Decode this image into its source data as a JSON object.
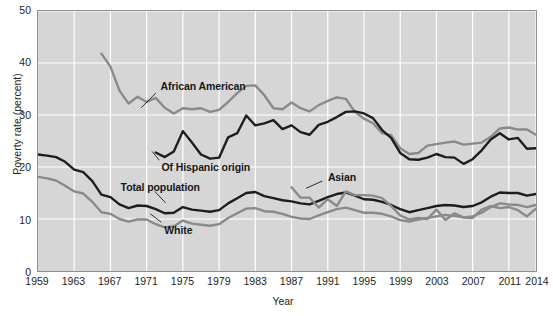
{
  "chart_data": {
    "type": "line",
    "title": "",
    "xlabel": "Year",
    "ylabel": "Poverty rate (percent)",
    "xlim": [
      1959,
      2014
    ],
    "ylim": [
      0,
      50
    ],
    "ytick_values": [
      0,
      10,
      20,
      30,
      40,
      50
    ],
    "ytick_labels": [
      "0",
      "10",
      "20",
      "30",
      "40",
      "50"
    ],
    "xtick_values": [
      1959,
      1963,
      1967,
      1971,
      1975,
      1979,
      1983,
      1987,
      1991,
      1995,
      1999,
      2003,
      2007,
      2011,
      2014
    ],
    "xtick_labels": [
      "1959",
      "1963",
      "1967",
      "1971",
      "1975",
      "1979",
      "1983",
      "1987",
      "1991",
      "1995",
      "1999",
      "2003",
      "2007",
      "2011",
      "2014"
    ],
    "grid": "both",
    "legend_position": "inline-annotations",
    "plot_background": "#d6d6d6",
    "gridline_color": "#ffffff",
    "series": [
      {
        "name": "African American",
        "color": "#8a8a8a",
        "label_x": 1972.6,
        "label_y": 35.6,
        "leader_from": [
          1972.0,
          34.2
        ],
        "leader_to": [
          1970.4,
          31.4
        ],
        "x": [
          1966,
          1967,
          1968,
          1969,
          1970,
          1971,
          1972,
          1973,
          1974,
          1975,
          1976,
          1977,
          1978,
          1979,
          1980,
          1981,
          1982,
          1983,
          1984,
          1985,
          1986,
          1987,
          1988,
          1989,
          1990,
          1991,
          1992,
          1993,
          1994,
          1995,
          1996,
          1997,
          1998,
          1999,
          2000,
          2001,
          2002,
          2003,
          2004,
          2005,
          2006,
          2007,
          2008,
          2009,
          2010,
          2011,
          2012,
          2013,
          2014
        ],
        "values": [
          41.8,
          39.3,
          34.7,
          32.2,
          33.5,
          32.5,
          33.3,
          31.4,
          30.3,
          31.3,
          31.1,
          31.3,
          30.6,
          31.0,
          32.5,
          34.2,
          35.6,
          35.7,
          33.8,
          31.3,
          31.1,
          32.4,
          31.3,
          30.7,
          31.9,
          32.7,
          33.4,
          33.1,
          30.6,
          29.3,
          28.4,
          26.5,
          26.1,
          23.6,
          22.5,
          22.7,
          24.1,
          24.4,
          24.7,
          24.9,
          24.3,
          24.5,
          24.7,
          25.8,
          27.4,
          27.6,
          27.2,
          27.2,
          26.2
        ]
      },
      {
        "name": "Of Hispanic origin",
        "color": "#1d1d1d",
        "label_x": 1972.7,
        "label_y": 20.0,
        "leader_from": [
          1972.4,
          21.3
        ],
        "leader_to": [
          1971.6,
          23.0
        ],
        "x": [
          1972,
          1973,
          1974,
          1975,
          1976,
          1977,
          1978,
          1979,
          1980,
          1981,
          1982,
          1983,
          1984,
          1985,
          1986,
          1987,
          1988,
          1989,
          1990,
          1991,
          1992,
          1993,
          1994,
          1995,
          1996,
          1997,
          1998,
          1999,
          2000,
          2001,
          2002,
          2003,
          2004,
          2005,
          2006,
          2007,
          2008,
          2009,
          2010,
          2011,
          2012,
          2013,
          2014
        ],
        "values": [
          22.8,
          21.9,
          23.0,
          26.9,
          24.7,
          22.4,
          21.6,
          21.8,
          25.7,
          26.5,
          29.9,
          28.0,
          28.4,
          29.0,
          27.3,
          28.0,
          26.7,
          26.2,
          28.1,
          28.7,
          29.6,
          30.6,
          30.7,
          30.3,
          29.4,
          27.1,
          25.6,
          22.7,
          21.5,
          21.4,
          21.8,
          22.5,
          21.9,
          21.8,
          20.6,
          21.5,
          23.2,
          25.3,
          26.5,
          25.3,
          25.6,
          23.5,
          23.6
        ]
      },
      {
        "name": "Total population",
        "color": "#1d1d1d",
        "label_x": 1968.2,
        "label_y": 16.2,
        "leader_from": [
          1971.9,
          15.3
        ],
        "leader_to": [
          1973.1,
          13.1
        ],
        "x": [
          1959,
          1960,
          1961,
          1962,
          1963,
          1964,
          1965,
          1966,
          1967,
          1968,
          1969,
          1970,
          1971,
          1972,
          1973,
          1974,
          1975,
          1976,
          1977,
          1978,
          1979,
          1980,
          1981,
          1982,
          1983,
          1984,
          1985,
          1986,
          1987,
          1988,
          1989,
          1990,
          1991,
          1992,
          1993,
          1994,
          1995,
          1996,
          1997,
          1998,
          1999,
          2000,
          2001,
          2002,
          2003,
          2004,
          2005,
          2006,
          2007,
          2008,
          2009,
          2010,
          2011,
          2012,
          2013,
          2014
        ],
        "values": [
          22.4,
          22.2,
          21.9,
          21.0,
          19.5,
          19.0,
          17.3,
          14.7,
          14.2,
          12.8,
          12.1,
          12.6,
          12.5,
          11.9,
          11.1,
          11.2,
          12.3,
          11.8,
          11.6,
          11.4,
          11.7,
          13.0,
          14.0,
          15.0,
          15.2,
          14.4,
          14.0,
          13.6,
          13.4,
          13.0,
          12.8,
          13.5,
          14.2,
          14.8,
          15.1,
          14.5,
          13.8,
          13.7,
          13.3,
          12.7,
          11.9,
          11.3,
          11.7,
          12.1,
          12.5,
          12.7,
          12.6,
          12.3,
          12.5,
          13.2,
          14.3,
          15.1,
          15.0,
          15.0,
          14.5,
          14.8
        ]
      },
      {
        "name": "White",
        "color": "#8a8a8a",
        "label_x": 1973.0,
        "label_y": 8.1,
        "leader_from": [
          1972.6,
          9.4
        ],
        "leader_to": [
          1971.4,
          11.0
        ],
        "x": [
          1959,
          1960,
          1961,
          1962,
          1963,
          1964,
          1965,
          1966,
          1967,
          1968,
          1969,
          1970,
          1971,
          1972,
          1973,
          1974,
          1975,
          1976,
          1977,
          1978,
          1979,
          1980,
          1981,
          1982,
          1983,
          1984,
          1985,
          1986,
          1987,
          1988,
          1989,
          1990,
          1991,
          1992,
          1993,
          1994,
          1995,
          1996,
          1997,
          1998,
          1999,
          2000,
          2001,
          2002,
          2003,
          2004,
          2005,
          2006,
          2007,
          2008,
          2009,
          2010,
          2011,
          2012,
          2013,
          2014
        ],
        "values": [
          18.1,
          17.8,
          17.4,
          16.4,
          15.3,
          14.9,
          13.3,
          11.3,
          11.0,
          10.0,
          9.5,
          9.9,
          9.9,
          9.0,
          8.4,
          8.6,
          9.7,
          9.1,
          8.9,
          8.7,
          9.0,
          10.2,
          11.1,
          12.0,
          12.1,
          11.5,
          11.4,
          11.0,
          10.4,
          10.1,
          10.0,
          10.7,
          11.3,
          11.9,
          12.2,
          11.7,
          11.2,
          11.2,
          11.0,
          10.5,
          9.8,
          9.5,
          9.9,
          10.2,
          10.5,
          10.8,
          10.6,
          10.3,
          10.5,
          11.2,
          12.3,
          13.0,
          12.8,
          12.7,
          12.3,
          12.7
        ]
      },
      {
        "name": "Asian",
        "color": "#8a8a8a",
        "label_x": 1991.0,
        "label_y": 18.2,
        "leader_from": [
          1990.4,
          17.3
        ],
        "leader_to": [
          1988.6,
          15.9
        ],
        "x": [
          1987,
          1988,
          1989,
          1990,
          1991,
          1992,
          1993,
          1994,
          1995,
          1996,
          1997,
          1998,
          1999,
          2000,
          2001,
          2002,
          2003,
          2004,
          2005,
          2006,
          2007,
          2008,
          2009,
          2010,
          2011,
          2012,
          2013,
          2014
        ],
        "values": [
          16.1,
          14.1,
          14.1,
          12.2,
          13.8,
          12.5,
          15.3,
          14.6,
          14.6,
          14.5,
          14.0,
          12.5,
          10.7,
          9.9,
          10.2,
          10.0,
          11.8,
          9.8,
          11.1,
          10.3,
          10.2,
          11.8,
          12.5,
          12.1,
          12.3,
          11.7,
          10.5,
          12.0
        ]
      }
    ]
  }
}
